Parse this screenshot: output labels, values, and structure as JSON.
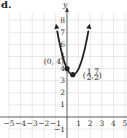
{
  "panel": {
    "label": "d."
  },
  "chart_data": {
    "type": "line",
    "title": "",
    "xlabel": "",
    "ylabel": "y",
    "xlim": [
      -5,
      5
    ],
    "ylim": [
      -2,
      8.5
    ],
    "grid": true,
    "x_ticks": [
      "-5",
      "-4",
      "-3",
      "-2",
      "-1",
      "1",
      "2",
      "3",
      "4",
      "5"
    ],
    "y_ticks": [
      "-1",
      "1",
      "2",
      "3",
      "4",
      "5",
      "6",
      "7",
      "8"
    ],
    "series": [
      {
        "name": "parabola",
        "equation": "y = 2(x - 1/2)^2 + 7/2",
        "x": [
          -0.9,
          -0.5,
          0,
          0.5,
          1,
          1.5,
          1.9
        ],
        "y": [
          7.42,
          5.5,
          4,
          3.5,
          4,
          5.5,
          7.42
        ]
      }
    ],
    "points": [
      {
        "label": "(0, 4)",
        "x": 0,
        "y": 4
      },
      {
        "label": "(1/2, 7/2)",
        "x": 0.5,
        "y": 3.5
      }
    ],
    "annotations": {
      "point1": "(0, 4)",
      "point2_num_x": "1",
      "point2_den_x": "2",
      "point2_num_y": "7",
      "point2_den_y": "2"
    }
  },
  "colors": {
    "curve": "#222222",
    "grid": "#d6d6d6",
    "axis": "#444444"
  }
}
